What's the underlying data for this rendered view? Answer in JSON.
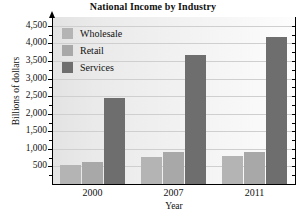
{
  "chart_data": {
    "type": "bar",
    "title": "National Income by Industry",
    "xlabel": "Year",
    "ylabel": "Billions of dollars",
    "categories": [
      "2000",
      "2007",
      "2011"
    ],
    "series": [
      {
        "name": "Wholesale",
        "color": "#b4b4b4",
        "values": [
          550,
          780,
          800
        ]
      },
      {
        "name": "Retail",
        "color": "#a8a8a8",
        "values": [
          630,
          900,
          910
        ]
      },
      {
        "name": "Services",
        "color": "#6e6e6e",
        "values": [
          2450,
          3680,
          4180
        ]
      }
    ],
    "ylim": [
      0,
      4750
    ],
    "ytick_values": [
      500,
      1000,
      1500,
      2000,
      2500,
      3000,
      3500,
      4000,
      4500
    ],
    "ytick_labels": [
      "500",
      "1,000",
      "1,500",
      "2,000",
      "2,500",
      "3,000",
      "3,500",
      "4,000",
      "4,500"
    ],
    "grid": true,
    "legend_position": "top-left-inside",
    "plot_background": "#eeeeee"
  }
}
